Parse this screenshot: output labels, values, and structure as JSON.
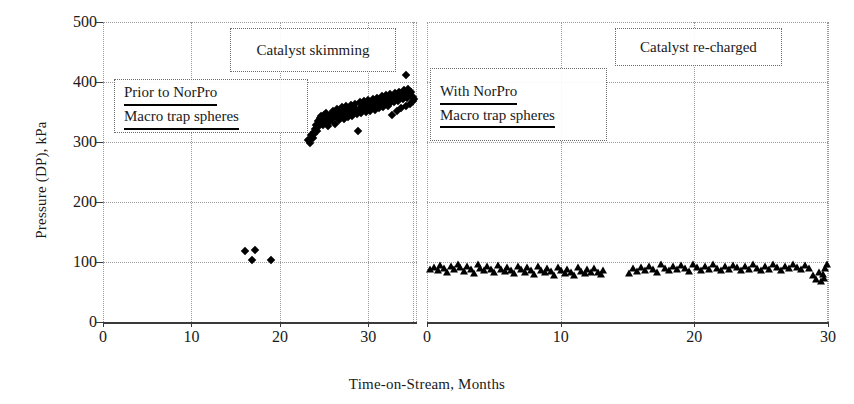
{
  "chart_data": {
    "type": "scatter",
    "title": "",
    "xlabel": "Time-on-Stream, Months",
    "ylabel": "Pressure (DP), kPa",
    "ylim": [
      0,
      500
    ],
    "yticks": [
      0,
      100,
      200,
      300,
      400,
      500
    ],
    "grid": true,
    "legend_position": "none",
    "panels": [
      {
        "name": "left-panel",
        "xlim": [
          0,
          35.5
        ],
        "xticks": [
          0,
          10,
          20,
          30
        ],
        "marker": "diamond",
        "annotations": [
          {
            "name": "catalyst-skimming",
            "lines": [
              "Catalyst skimming"
            ],
            "underline": false
          },
          {
            "name": "prior-to-norpro",
            "lines": [
              "Prior to NorPro",
              "Macro trap spheres"
            ],
            "underline": true
          }
        ],
        "series": [
          {
            "name": "Prior to NorPro Macro trap spheres",
            "x": [
              16.1,
              16.9,
              17.2,
              19.0,
              23.2,
              23.4,
              23.5,
              23.7,
              23.8,
              23.9,
              24.0,
              24.1,
              24.2,
              24.3,
              24.4,
              24.5,
              24.6,
              24.7,
              24.8,
              24.9,
              25.0,
              25.1,
              25.2,
              25.3,
              25.4,
              25.5,
              25.6,
              25.8,
              25.9,
              26.0,
              26.1,
              26.2,
              26.3,
              26.4,
              26.5,
              26.6,
              26.7,
              26.8,
              26.9,
              27.0,
              27.1,
              27.2,
              27.3,
              27.4,
              27.5,
              27.6,
              27.7,
              27.8,
              27.9,
              28.0,
              28.1,
              28.2,
              28.3,
              28.4,
              28.5,
              28.6,
              28.7,
              28.8,
              28.9,
              29.0,
              29.1,
              29.2,
              29.3,
              29.4,
              29.5,
              29.6,
              29.7,
              29.8,
              29.9,
              30.0,
              30.1,
              30.2,
              30.3,
              30.4,
              30.5,
              30.6,
              30.7,
              30.8,
              30.9,
              31.0,
              31.1,
              31.2,
              31.3,
              31.4,
              31.5,
              31.6,
              31.7,
              31.8,
              31.9,
              32.0,
              32.1,
              32.2,
              32.3,
              32.4,
              32.5,
              32.6,
              32.7,
              32.8,
              32.9,
              33.0,
              33.1,
              33.2,
              33.3,
              33.4,
              33.5,
              33.6,
              33.7,
              33.8,
              33.9,
              34.0,
              34.1,
              34.2,
              34.3,
              34.4,
              34.5,
              34.6,
              34.7,
              34.8,
              34.9,
              35.0,
              35.1,
              35.2,
              34.2
            ],
            "y": [
              118,
              104,
              120,
              103,
              303,
              299,
              311,
              307,
              317,
              314,
              322,
              329,
              318,
              335,
              326,
              340,
              331,
              343,
              337,
              328,
              345,
              333,
              348,
              339,
              326,
              342,
              334,
              347,
              338,
              352,
              344,
              330,
              349,
              341,
              355,
              346,
              336,
              351,
              343,
              358,
              348,
              339,
              353,
              345,
              360,
              350,
              342,
              356,
              347,
              362,
              352,
              344,
              358,
              349,
              364,
              354,
              346,
              319,
              351,
              366,
              356,
              348,
              360,
              353,
              368,
              358,
              350,
              362,
              355,
              370,
              360,
              352,
              365,
              357,
              372,
              362,
              354,
              367,
              359,
              374,
              364,
              356,
              369,
              361,
              376,
              366,
              358,
              371,
              363,
              378,
              368,
              360,
              373,
              365,
              380,
              370,
              345,
              375,
              367,
              382,
              372,
              352,
              377,
              369,
              384,
              374,
              356,
              379,
              371,
              386,
              376,
              360,
              381,
              373,
              388,
              378,
              364,
              383,
              375,
              375,
              368,
              372,
              412
            ]
          }
        ]
      },
      {
        "name": "right-panel",
        "xlim": [
          0,
          30
        ],
        "xticks": [
          0,
          10,
          20,
          30
        ],
        "marker": "triangle",
        "annotations": [
          {
            "name": "with-norpro",
            "lines": [
              "With NorPro",
              "Macro trap spheres"
            ],
            "underline": true
          },
          {
            "name": "catalyst-re-charged",
            "lines": [
              "Catalyst re-charged"
            ],
            "underline": false
          }
        ],
        "series": [
          {
            "name": "With NorPro Macro trap spheres",
            "x": [
              0.2,
              0.5,
              0.8,
              1.0,
              1.3,
              1.5,
              1.8,
              2.0,
              2.3,
              2.5,
              2.8,
              3.0,
              3.3,
              3.5,
              3.8,
              4.0,
              4.3,
              4.5,
              4.8,
              5.0,
              5.3,
              5.5,
              5.8,
              6.0,
              6.3,
              6.5,
              6.8,
              7.0,
              7.3,
              7.5,
              7.8,
              8.0,
              8.3,
              8.5,
              8.8,
              9.0,
              9.3,
              9.5,
              9.8,
              10.0,
              10.3,
              10.5,
              10.8,
              11.0,
              11.3,
              11.5,
              11.8,
              12.0,
              12.3,
              12.5,
              12.8,
              13.0,
              13.2,
              15.1,
              15.4,
              15.7,
              16.0,
              16.3,
              16.6,
              16.9,
              17.2,
              17.5,
              17.8,
              18.1,
              18.4,
              18.7,
              19.0,
              19.3,
              19.6,
              19.9,
              20.2,
              20.5,
              20.8,
              21.1,
              21.4,
              21.7,
              22.0,
              22.3,
              22.6,
              22.9,
              23.2,
              23.5,
              23.8,
              24.1,
              24.4,
              24.7,
              25.0,
              25.3,
              25.6,
              25.9,
              26.2,
              26.5,
              26.8,
              27.1,
              27.4,
              27.7,
              28.0,
              28.3,
              28.6,
              28.9,
              29.1,
              29.3,
              29.5,
              29.6,
              29.7,
              29.8,
              29.9
            ],
            "y": [
              88,
              92,
              86,
              95,
              90,
              84,
              93,
              88,
              97,
              91,
              85,
              94,
              89,
              82,
              96,
              90,
              86,
              93,
              88,
              83,
              95,
              89,
              85,
              92,
              87,
              81,
              94,
              88,
              84,
              91,
              86,
              80,
              93,
              87,
              83,
              90,
              85,
              79,
              92,
              86,
              82,
              89,
              84,
              78,
              91,
              85,
              81,
              88,
              83,
              90,
              84,
              80,
              86,
              82,
              90,
              85,
              92,
              87,
              94,
              89,
              84,
              96,
              90,
              86,
              93,
              88,
              95,
              90,
              85,
              97,
              91,
              87,
              94,
              89,
              96,
              90,
              86,
              93,
              88,
              95,
              91,
              87,
              94,
              89,
              96,
              90,
              86,
              93,
              89,
              96,
              91,
              87,
              94,
              90,
              97,
              92,
              88,
              95,
              90,
              78,
              72,
              84,
              68,
              80,
              74,
              90,
              96
            ]
          }
        ]
      }
    ]
  },
  "axes": {
    "y_title": "Pressure (DP), kPa",
    "x_title": "Time-on-Stream, Months",
    "y_ticks": [
      "0",
      "100",
      "200",
      "300",
      "400",
      "500"
    ],
    "left_x_ticks": [
      "0",
      "10",
      "20",
      "30"
    ],
    "right_x_ticks": [
      "0",
      "10",
      "20",
      "30"
    ]
  },
  "annotations": {
    "catalyst_skimming": "Catalyst skimming",
    "prior_line1": "Prior to NorPro",
    "prior_line2": "Macro trap spheres",
    "with_line1": "With NorPro",
    "with_line2": "Macro trap spheres",
    "catalyst_recharged": "Catalyst re-charged"
  },
  "colors": {
    "marker": "#000000",
    "axis": "#3a3a3a",
    "grid": "#9a9a9a",
    "background": "#ffffff"
  }
}
